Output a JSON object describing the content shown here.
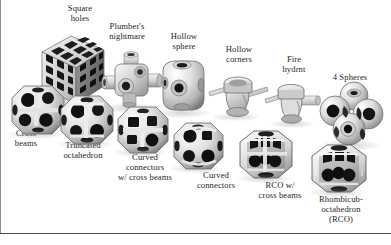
{
  "figure": {
    "background_color": "#ffffff",
    "text_color": "#241f1e",
    "rule_color": "#4a4a4a",
    "border_color": "#8c8c8c",
    "object_count": 13
  },
  "labels": {
    "square_holes": "Square\nholes",
    "plumbers_nightmare": "Plumber's\nnightmare",
    "hollow_sphere": "Hollow\nsphere",
    "hollow_corners": "Hollow\ncorners",
    "fire_hydrant": "Fire\nhydrnt",
    "four_spheres": "4 Spheres",
    "cross_beams": "Cross\nbeams",
    "truncated_octahedron": "Truncated\noctahedron",
    "curved_connectors_cross_beams": "Curved\nconnectors\nw/ cross beams",
    "curved_connectors": "Curved\nconnectors",
    "rco_cross_beams": "RCO w/\ncross beams",
    "rhombicuboctahedron": "Rhombicub-\noctahedron\n(RCO)"
  },
  "specimens": [
    {
      "id": "square-holes",
      "name": "square-holes-cube",
      "shape": "perforated-cube"
    },
    {
      "id": "plumbers-nightmare",
      "name": "plumbers-nightmare-cube",
      "shape": "tubed-cube"
    },
    {
      "id": "hollow-sphere",
      "name": "hollow-sphere",
      "shape": "rounded-cube-with-holes"
    },
    {
      "id": "hollow-corners",
      "name": "hollow-corners",
      "shape": "disc-with-cross-arms"
    },
    {
      "id": "fire-hydrant",
      "name": "fire-hydrant",
      "shape": "disc-with-cross-arms"
    },
    {
      "id": "four-spheres",
      "name": "four-spheres-cluster",
      "shape": "sphere-cluster"
    },
    {
      "id": "cross-beams",
      "name": "cross-beams-polyhedron",
      "shape": "porous-polyhedron"
    },
    {
      "id": "truncated-octahedron",
      "name": "truncated-octahedron",
      "shape": "porous-polyhedron"
    },
    {
      "id": "curved-cross-beams",
      "name": "curved-connectors-cross-beams",
      "shape": "porous-polyhedron"
    },
    {
      "id": "curved-connectors",
      "name": "curved-connectors",
      "shape": "porous-polyhedron"
    },
    {
      "id": "rco-cross-beams",
      "name": "rco-with-cross-beams",
      "shape": "rhombicuboctahedron-shell"
    },
    {
      "id": "rco",
      "name": "rhombicuboctahedron",
      "shape": "rhombicuboctahedron-shell"
    }
  ]
}
